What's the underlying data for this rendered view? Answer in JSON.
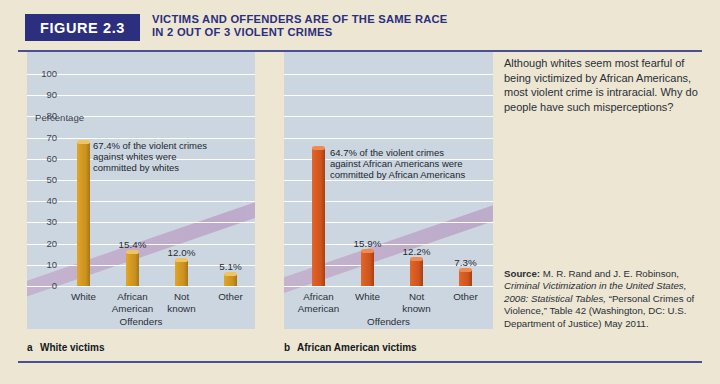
{
  "figure": {
    "tag": "FIGURE 2.3",
    "title_line1": "VICTIMS AND OFFENDERS ARE OF THE SAME RACE",
    "title_line2": "IN 2 OUT OF 3 VIOLENT CRIMES"
  },
  "colors": {
    "header_blue": "#2b2f7e",
    "rule": "#4a4f93",
    "page_bg": "#ece6d2",
    "panel_bg": "#ccd6e0",
    "bar_gold": "#d49a22",
    "bar_orange": "#d85c22",
    "band": "#c3a9c9"
  },
  "side_note": "Although whites seem most fearful of being victimized by African Americans, most violent crime is intraracial. Why do people have such misperceptions?",
  "source": {
    "label": "Source:",
    "line1": " M. R. Rand and J. E. Robinson,",
    "italic1": "Criminal Victimization in the United",
    "italic2": "States, 2008: Statistical Tables,",
    "line2": "“Personal Crimes of Violence,” Table 42",
    "line3": "(Washington, DC: U.S. Department of",
    "line4": "Justice) May 2011."
  },
  "captions": {
    "a_letter": "a",
    "a_text": "White victims",
    "b_letter": "b",
    "b_text": "African American victims"
  },
  "chart_data": [
    {
      "type": "bar",
      "id": "white-victims",
      "title": "a  White victims",
      "ylabel": "Percentage",
      "xlabel": "Offenders",
      "ylim": [
        0,
        100
      ],
      "yticks": [
        0,
        10,
        20,
        30,
        40,
        50,
        60,
        70,
        80,
        90,
        100
      ],
      "grid": true,
      "categories": [
        "White",
        "African American",
        "Not known",
        "Other"
      ],
      "category_lines": [
        [
          "White"
        ],
        [
          "African",
          "American"
        ],
        [
          "Not",
          "known"
        ],
        [
          "Other"
        ]
      ],
      "values": [
        67.4,
        15.4,
        12.0,
        5.1
      ],
      "value_labels": [
        "",
        "15.4%",
        "12.0%",
        "5.1%"
      ],
      "bar_color": "#d49a22",
      "annotation": [
        "67.4% of the violent crimes",
        "against whites were",
        "committed by whites"
      ]
    },
    {
      "type": "bar",
      "id": "african-american-victims",
      "title": "b  African American victims",
      "ylabel": "",
      "xlabel": "Offenders",
      "ylim": [
        0,
        100
      ],
      "yticks": [
        0,
        10,
        20,
        30,
        40,
        50,
        60,
        70,
        80,
        90,
        100
      ],
      "grid": true,
      "categories": [
        "African American",
        "White",
        "Not known",
        "Other"
      ],
      "category_lines": [
        [
          "African",
          "American"
        ],
        [
          "White"
        ],
        [
          "Not",
          "known"
        ],
        [
          "Other"
        ]
      ],
      "values": [
        64.7,
        15.9,
        12.2,
        7.3
      ],
      "value_labels": [
        "",
        "15.9%",
        "12.2%",
        "7.3%"
      ],
      "bar_color": "#d85c22",
      "annotation": [
        "64.7% of the violent crimes",
        "against African Americans were",
        "committed by African Americans"
      ]
    }
  ]
}
